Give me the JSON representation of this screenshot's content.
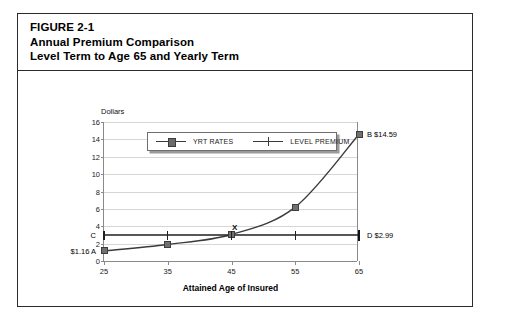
{
  "figure": {
    "title_lines": [
      "FIGURE 2-1",
      "Annual Premium Comparison",
      "Level Term to Age 65 and Yearly Term"
    ]
  },
  "chart_data": {
    "type": "line",
    "title": "Annual Premium Comparison",
    "xlabel": "Attained Age of Insured",
    "ylabel": "Dollars",
    "x": [
      25,
      35,
      45,
      55,
      65
    ],
    "xlim": [
      25,
      65
    ],
    "ylim": [
      0,
      16
    ],
    "xticks": [
      "25",
      "35",
      "45",
      "55",
      "65"
    ],
    "yticks": [
      "0",
      "2",
      "4",
      "6",
      "8",
      "10",
      "12",
      "14",
      "16"
    ],
    "grid": true,
    "legend_position": "top-left-inside",
    "series": [
      {
        "name": "YRT RATES",
        "marker": "filled-square",
        "values": [
          1.16,
          1.9,
          3.05,
          6.2,
          14.59
        ]
      },
      {
        "name": "LEVEL PREMIUM",
        "marker": "plus",
        "values": [
          2.99,
          2.99,
          2.99,
          2.99,
          2.99
        ]
      }
    ],
    "annotations": [
      {
        "id": "A",
        "text": "$1.16  A",
        "x": 25,
        "y": 1.16,
        "placement": "left"
      },
      {
        "id": "B",
        "text": "B $14.59",
        "x": 65,
        "y": 14.59,
        "placement": "right"
      },
      {
        "id": "C",
        "text": "C",
        "x": 25,
        "y": 2.99,
        "placement": "left"
      },
      {
        "id": "D",
        "text": "D $2.99",
        "x": 65,
        "y": 2.99,
        "placement": "right"
      },
      {
        "id": "X",
        "text": "X",
        "x": 45.5,
        "y": 3.9,
        "placement": "above"
      }
    ]
  },
  "colors": {
    "frame_border": "#2b2b2b",
    "gridline": "#d6d6d6",
    "axis": "#8a8a8a",
    "yrt_line": "#3a3a3a",
    "yrt_marker": "#707070",
    "level_line": "#1f1f1f",
    "background": "#ffffff"
  }
}
